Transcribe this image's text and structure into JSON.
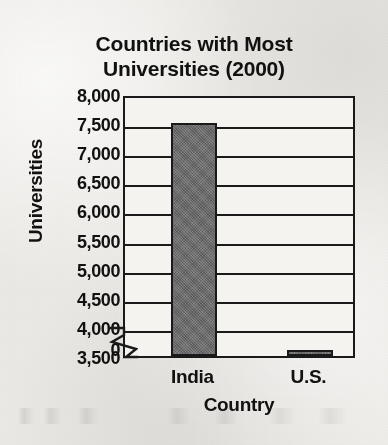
{
  "chart_data": {
    "type": "bar",
    "title": "Countries with Most\nUniversities (2000)",
    "title_line1": "Countries with Most",
    "title_line2": "Universities (2000)",
    "xlabel": "Country",
    "ylabel": "Universities",
    "categories": [
      "India",
      "U.S."
    ],
    "values": [
      7500,
      3600
    ],
    "ylim": [
      3500,
      8000
    ],
    "y_axis_break": true,
    "y_break_label": "0",
    "yticks": [
      8000,
      7500,
      7000,
      6500,
      6000,
      5500,
      5000,
      4500,
      4000,
      3500
    ],
    "ytick_labels": [
      "8,000",
      "7,500",
      "7,000",
      "6,500",
      "6,000",
      "5,500",
      "5,000",
      "4,500",
      "4,000",
      "3,500"
    ],
    "grid": true,
    "legend": null,
    "bar_color": "#6b6b6b",
    "bar_edge_color": "#1a1a1a",
    "background_color": "#ebe9e5",
    "plot_background_color": "#f4f3f0",
    "text_color": "#111111"
  }
}
